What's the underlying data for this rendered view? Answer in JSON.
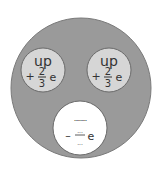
{
  "diagram": {
    "type": "proton-quark-model",
    "colors": {
      "outer": "#9a9a9a",
      "outer_stroke": "#7a7a7a",
      "quark_up": "#d6d6d6",
      "quark_blank": "#ffffff",
      "text": "#333333"
    },
    "quarks": [
      {
        "name": "up",
        "sign": "+",
        "numerator": "2",
        "denominator": "3",
        "unit": "e"
      },
      {
        "name": "up",
        "sign": "+",
        "numerator": "2",
        "denominator": "3",
        "unit": "e"
      },
      {
        "name": "..........",
        "sign": "–",
        "numerator": "...",
        "denominator": "...",
        "unit": "e"
      }
    ]
  }
}
